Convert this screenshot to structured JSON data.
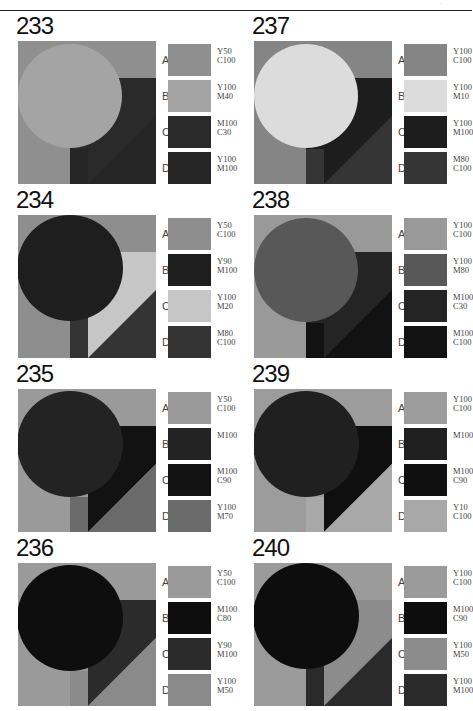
{
  "page": {
    "page_mark": "·"
  },
  "panels": [
    {
      "number": "233",
      "col": 0,
      "row": 0,
      "layout": "square",
      "colors": {
        "A": "#8f8f8f",
        "B": "#a4a4a4",
        "C": "#2a2a2a",
        "D": "#262626"
      },
      "swatches": [
        {
          "letter": "A",
          "label": "Y50\nC100"
        },
        {
          "letter": "B",
          "label": "Y100\nM40"
        },
        {
          "letter": "C",
          "label": "M100\nC30"
        },
        {
          "letter": "D",
          "label": "Y100\nM100"
        }
      ]
    },
    {
      "number": "237",
      "col": 1,
      "row": 0,
      "layout": "square",
      "colors": {
        "A": "#858585",
        "B": "#dcdcdc",
        "C": "#1d1d1d",
        "D": "#353535"
      },
      "swatches": [
        {
          "letter": "A",
          "label": "Y100\nC100"
        },
        {
          "letter": "B",
          "label": "Y100\nM10"
        },
        {
          "letter": "C",
          "label": "Y100\nM100"
        },
        {
          "letter": "D",
          "label": "M80\nC100"
        }
      ]
    },
    {
      "number": "234",
      "col": 0,
      "row": 1,
      "layout": "tree",
      "colors": {
        "A": "#8e8e8e",
        "B": "#1e1e1e",
        "C": "#c6c6c6",
        "D": "#343434"
      },
      "swatches": [
        {
          "letter": "A",
          "label": "Y50\nC100"
        },
        {
          "letter": "B",
          "label": "Y90\nM100"
        },
        {
          "letter": "C",
          "label": "Y100\nM20"
        },
        {
          "letter": "D",
          "label": "M80\nC100"
        }
      ]
    },
    {
      "number": "238",
      "col": 1,
      "row": 1,
      "layout": "square",
      "colors": {
        "A": "#999999",
        "B": "#585858",
        "C": "#242424",
        "D": "#121212"
      },
      "swatches": [
        {
          "letter": "A",
          "label": "Y100\nC100"
        },
        {
          "letter": "B",
          "label": "Y100\nM80"
        },
        {
          "letter": "C",
          "label": "M100\nC30"
        },
        {
          "letter": "D",
          "label": "M100\nC100"
        }
      ]
    },
    {
      "number": "235",
      "col": 0,
      "row": 2,
      "layout": "flag",
      "colors": {
        "A": "#9a9a9a",
        "B": "#232323",
        "C": "#121212",
        "D": "#6b6b6b"
      },
      "swatches": [
        {
          "letter": "A",
          "label": "Y50\nC100"
        },
        {
          "letter": "B",
          "label": "M100"
        },
        {
          "letter": "C",
          "label": "M100\nC90"
        },
        {
          "letter": "D",
          "label": "Y100\nM70"
        }
      ]
    },
    {
      "number": "239",
      "col": 1,
      "row": 2,
      "layout": "flag",
      "colors": {
        "A": "#9c9c9c",
        "B": "#202020",
        "C": "#0f0f0f",
        "D": "#a8a8a8"
      },
      "swatches": [
        {
          "letter": "A",
          "label": "Y100\nC100"
        },
        {
          "letter": "B",
          "label": "M100"
        },
        {
          "letter": "C",
          "label": "M100\nC90"
        },
        {
          "letter": "D",
          "label": "Y10\nC100"
        }
      ]
    },
    {
      "number": "236",
      "col": 0,
      "row": 3,
      "layout": "flag",
      "colors": {
        "A": "#9a9a9a",
        "B": "#0e0e0e",
        "C": "#2b2b2b",
        "D": "#8a8a8a"
      },
      "swatches": [
        {
          "letter": "A",
          "label": "Y50\nC100"
        },
        {
          "letter": "B",
          "label": "M100\nC80"
        },
        {
          "letter": "C",
          "label": "Y90\nM100"
        },
        {
          "letter": "D",
          "label": "Y100\nM50"
        }
      ]
    },
    {
      "number": "240",
      "col": 1,
      "row": 3,
      "layout": "tree",
      "colors": {
        "A": "#9b9b9b",
        "B": "#0d0d0d",
        "C": "#8c8c8c",
        "D": "#2a2a2a"
      },
      "swatches": [
        {
          "letter": "A",
          "label": "Y100\nC100"
        },
        {
          "letter": "B",
          "label": "M100\nC90"
        },
        {
          "letter": "C",
          "label": "Y100\nM50"
        },
        {
          "letter": "D",
          "label": "Y100\nM100"
        }
      ]
    }
  ]
}
